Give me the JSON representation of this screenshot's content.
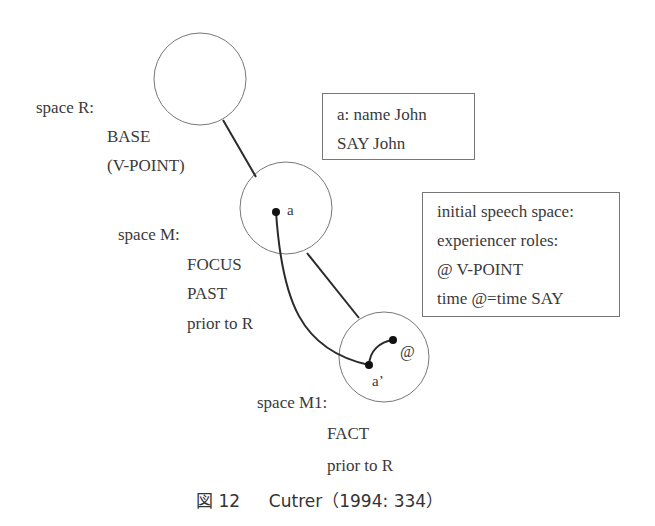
{
  "spaces": {
    "R": {
      "title": "space R:",
      "lines": [
        "BASE",
        "(V-POINT)"
      ]
    },
    "M": {
      "title": "space M:",
      "lines": [
        "FOCUS",
        "PAST",
        "prior to R"
      ],
      "element": "a"
    },
    "M1": {
      "title": "space M1:",
      "lines": [
        "FACT",
        "prior to R"
      ],
      "element": "a’",
      "viewpoint": "@"
    }
  },
  "boxes": {
    "name_box": {
      "lines": [
        "a: name John",
        "SAY John"
      ]
    },
    "speech_box": {
      "lines": [
        "initial speech space:",
        "experiencer roles:",
        "@ V-POINT",
        "time @=time SAY"
      ]
    }
  },
  "caption": {
    "figure_label": "図 12",
    "text": "Cutrer（1994: 334）"
  },
  "colors": {
    "circle_stroke": "#777777",
    "connector": "#2a2a2a",
    "text": "#3a3a3a"
  }
}
